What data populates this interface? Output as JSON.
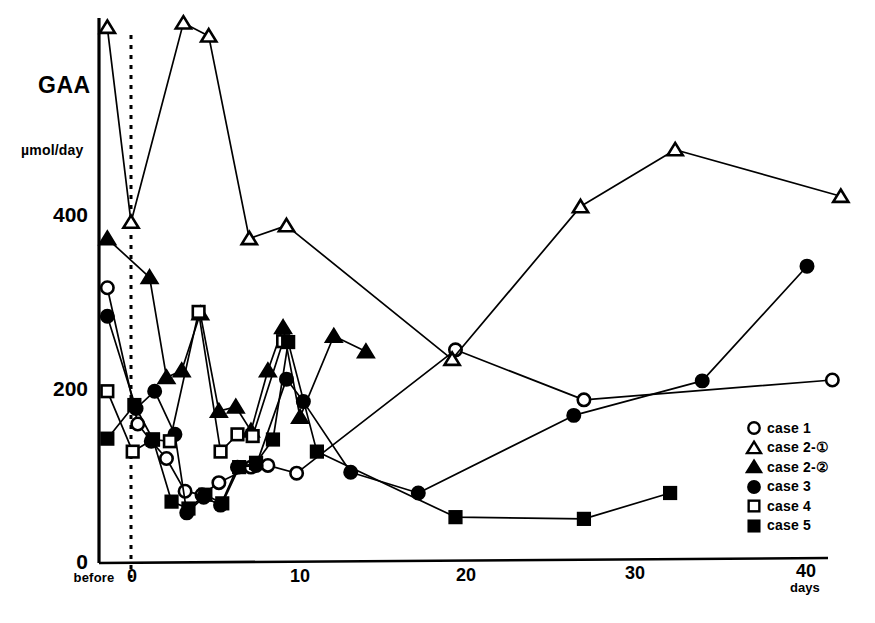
{
  "chart_data": {
    "type": "line",
    "title": "GAA",
    "ylabel": "µmol/day",
    "xlabel": "days",
    "xlim": [
      -2.2,
      43
    ],
    "ylim": [
      0,
      660
    ],
    "grid": false,
    "legend_position": "bottom-right",
    "y_ticks": [
      0,
      200,
      400
    ],
    "y_tick_labels": [
      "0",
      "200",
      "400"
    ],
    "x_ticks": [
      -1.4,
      0,
      10,
      20,
      30,
      40
    ],
    "x_tick_labels": [
      "before",
      "0",
      "10",
      "20",
      "30",
      "40"
    ],
    "baseline_marker": {
      "label": "0",
      "x": 0,
      "style": "dotted-vertical"
    },
    "series": [
      {
        "name": "case 1",
        "legend_label": "case 1",
        "marker": "open-circle",
        "color": "#000000",
        "points": [
          {
            "x": -1.4,
            "y": 318
          },
          {
            "x": 0.4,
            "y": 160
          },
          {
            "x": 1.2,
            "y": 140
          },
          {
            "x": 2.1,
            "y": 120
          },
          {
            "x": 3.2,
            "y": 82
          },
          {
            "x": 4.2,
            "y": 78
          },
          {
            "x": 5.2,
            "y": 92
          },
          {
            "x": 7.1,
            "y": 110
          },
          {
            "x": 8.1,
            "y": 112
          },
          {
            "x": 9.8,
            "y": 103
          },
          {
            "x": 19.2,
            "y": 246
          },
          {
            "x": 26.8,
            "y": 188
          },
          {
            "x": 41.5,
            "y": 211
          }
        ]
      },
      {
        "name": "case 2-1",
        "legend_label": "case 2-①",
        "marker": "open-triangle",
        "color": "#000000",
        "points": [
          {
            "x": -1.4,
            "y": 620
          },
          {
            "x": 0.0,
            "y": 394
          },
          {
            "x": 3.1,
            "y": 625
          },
          {
            "x": 4.6,
            "y": 610
          },
          {
            "x": 7.0,
            "y": 375
          },
          {
            "x": 9.2,
            "y": 390
          },
          {
            "x": 19.0,
            "y": 235
          },
          {
            "x": 26.6,
            "y": 412
          },
          {
            "x": 32.2,
            "y": 478
          },
          {
            "x": 42.0,
            "y": 424
          }
        ]
      },
      {
        "name": "case 2-2",
        "legend_label": "case 2-②",
        "marker": "filled-triangle",
        "color": "#000000",
        "points": [
          {
            "x": -1.4,
            "y": 375
          },
          {
            "x": 1.1,
            "y": 330
          },
          {
            "x": 2.1,
            "y": 214
          },
          {
            "x": 3.0,
            "y": 222
          },
          {
            "x": 4.1,
            "y": 288
          },
          {
            "x": 5.2,
            "y": 175
          },
          {
            "x": 6.2,
            "y": 180
          },
          {
            "x": 7.1,
            "y": 152
          },
          {
            "x": 8.1,
            "y": 222
          },
          {
            "x": 9.0,
            "y": 272
          },
          {
            "x": 10.0,
            "y": 168
          },
          {
            "x": 12.0,
            "y": 262
          },
          {
            "x": 13.9,
            "y": 244
          }
        ]
      },
      {
        "name": "case 3",
        "legend_label": "case 3",
        "marker": "filled-circle",
        "color": "#000000",
        "points": [
          {
            "x": -1.4,
            "y": 285
          },
          {
            "x": 0.3,
            "y": 178
          },
          {
            "x": 1.4,
            "y": 198
          },
          {
            "x": 2.6,
            "y": 148
          },
          {
            "x": 3.3,
            "y": 57
          },
          {
            "x": 4.3,
            "y": 75
          },
          {
            "x": 5.3,
            "y": 66
          },
          {
            "x": 6.3,
            "y": 110
          },
          {
            "x": 7.4,
            "y": 112
          },
          {
            "x": 9.2,
            "y": 212
          },
          {
            "x": 10.2,
            "y": 186
          },
          {
            "x": 13.0,
            "y": 104
          },
          {
            "x": 17.0,
            "y": 80
          },
          {
            "x": 26.2,
            "y": 170
          },
          {
            "x": 33.8,
            "y": 210
          },
          {
            "x": 40.0,
            "y": 343
          }
        ]
      },
      {
        "name": "case 4",
        "legend_label": "case 4",
        "marker": "open-square",
        "color": "#000000",
        "points": [
          {
            "x": -1.4,
            "y": 198
          },
          {
            "x": 0.1,
            "y": 128
          },
          {
            "x": 1.3,
            "y": 142
          },
          {
            "x": 2.3,
            "y": 140
          },
          {
            "x": 4.0,
            "y": 290
          },
          {
            "x": 5.3,
            "y": 128
          },
          {
            "x": 6.3,
            "y": 148
          },
          {
            "x": 7.2,
            "y": 146
          },
          {
            "x": 9.0,
            "y": 256
          }
        ]
      },
      {
        "name": "case 5",
        "legend_label": "case 5",
        "marker": "filled-square",
        "color": "#000000",
        "points": [
          {
            "x": -1.4,
            "y": 143
          },
          {
            "x": 0.2,
            "y": 182
          },
          {
            "x": 1.3,
            "y": 142
          },
          {
            "x": 2.4,
            "y": 70
          },
          {
            "x": 3.4,
            "y": 62
          },
          {
            "x": 4.4,
            "y": 78
          },
          {
            "x": 5.4,
            "y": 68
          },
          {
            "x": 6.4,
            "y": 110
          },
          {
            "x": 7.4,
            "y": 115
          },
          {
            "x": 8.4,
            "y": 142
          },
          {
            "x": 9.3,
            "y": 255
          },
          {
            "x": 11.0,
            "y": 128
          },
          {
            "x": 19.2,
            "y": 52
          },
          {
            "x": 26.8,
            "y": 50
          },
          {
            "x": 31.9,
            "y": 80
          }
        ]
      }
    ]
  }
}
